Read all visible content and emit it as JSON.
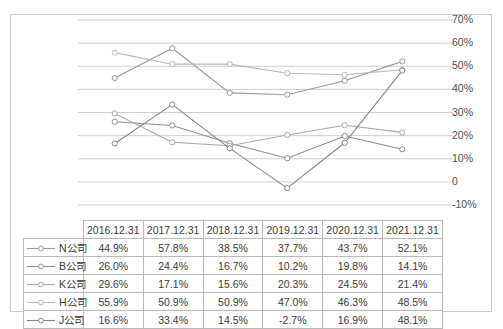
{
  "chart_data": {
    "type": "line",
    "title": "",
    "subtitle": "",
    "xlabel": "",
    "ylabel": "",
    "grid": true,
    "legend_position": "table-left",
    "categories": [
      "2016.12.31",
      "2017.12.31",
      "2018.12.31",
      "2019.12.31",
      "2020.12.31",
      "2021.12.31"
    ],
    "ylim": [
      -10,
      70
    ],
    "y_tick_step": 10,
    "y_tick_labels": [
      "70%",
      "60%",
      "50%",
      "40%",
      "30%",
      "20%",
      "10%",
      "0",
      "-10%"
    ],
    "y_tick_values": [
      70,
      60,
      50,
      40,
      30,
      20,
      10,
      0,
      -10
    ],
    "value_suffix": "%",
    "series": [
      {
        "name": "N公司",
        "color": "#9a9a9a",
        "marker": "circle-open",
        "values": [
          44.9,
          57.8,
          38.5,
          37.7,
          43.7,
          52.1
        ],
        "labels": [
          "44.9%",
          "57.8%",
          "38.5%",
          "37.7%",
          "43.7%",
          "52.1%"
        ]
      },
      {
        "name": "B公司",
        "color": "#8e8e8e",
        "marker": "circle-open",
        "values": [
          26.0,
          24.4,
          16.7,
          10.2,
          19.8,
          14.1
        ],
        "labels": [
          "26.0%",
          "24.4%",
          "16.7%",
          "10.2%",
          "19.8%",
          "14.1%"
        ]
      },
      {
        "name": "K公司",
        "color": "#a8a8a8",
        "marker": "circle-open",
        "values": [
          29.6,
          17.1,
          15.6,
          20.3,
          24.5,
          21.4
        ],
        "labels": [
          "29.6%",
          "17.1%",
          "15.6%",
          "20.3%",
          "24.5%",
          "21.4%"
        ]
      },
      {
        "name": "H公司",
        "color": "#b8b8b8",
        "marker": "circle-open",
        "values": [
          55.9,
          50.9,
          50.9,
          47.0,
          46.3,
          48.5
        ],
        "labels": [
          "55.9%",
          "50.9%",
          "50.9%",
          "47.0%",
          "46.3%",
          "48.5%"
        ]
      },
      {
        "name": "J公司",
        "color": "#868686",
        "marker": "circle-open",
        "values": [
          16.6,
          33.4,
          14.5,
          -2.7,
          16.9,
          48.1
        ],
        "labels": [
          "16.6%",
          "33.4%",
          "14.5%",
          "-2.7%",
          "16.9%",
          "48.1%"
        ]
      }
    ]
  },
  "table": {
    "corner_label": "",
    "headers": [
      "2016.12.31",
      "2017.12.31",
      "2018.12.31",
      "2019.12.31",
      "2020.12.31",
      "2021.12.31"
    ],
    "rows": [
      {
        "name": "N公司",
        "cells": [
          "44.9%",
          "57.8%",
          "38.5%",
          "37.7%",
          "43.7%",
          "52.1%"
        ]
      },
      {
        "name": "B公司",
        "cells": [
          "26.0%",
          "24.4%",
          "16.7%",
          "10.2%",
          "19.8%",
          "14.1%"
        ]
      },
      {
        "name": "K公司",
        "cells": [
          "29.6%",
          "17.1%",
          "15.6%",
          "20.3%",
          "24.5%",
          "21.4%"
        ]
      },
      {
        "name": "H公司",
        "cells": [
          "55.9%",
          "50.9%",
          "50.9%",
          "47.0%",
          "46.3%",
          "48.5%"
        ]
      },
      {
        "name": "J公司",
        "cells": [
          "16.6%",
          "33.4%",
          "14.5%",
          "-2.7%",
          "16.9%",
          "48.1%"
        ]
      }
    ]
  },
  "style": {
    "gridline_color": "#cfcfcf",
    "border_color": "#c9c9c9",
    "text_color": "#3a3a3a",
    "background": "#ffffff"
  }
}
